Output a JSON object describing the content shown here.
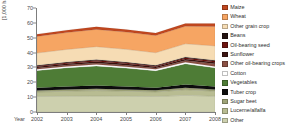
{
  "chart_data": {
    "type": "area",
    "stacked": true,
    "title": "",
    "xlabel": "Year",
    "ylabel": "[1,000 ha]",
    "ylim": [
      0,
      70
    ],
    "yticks": [
      0,
      10,
      20,
      30,
      40,
      50,
      60,
      70
    ],
    "grid": false,
    "legend_position": "right",
    "x": [
      2002,
      2003,
      2004,
      2005,
      2006,
      2007,
      2008
    ],
    "categories": [
      "2002",
      "2003",
      "2004",
      "2005",
      "2006",
      "2007",
      "2008"
    ],
    "series": [
      {
        "name": "Other",
        "color": "#cdd0ae",
        "values": [
          10.4,
          10.6,
          10.8,
          10.6,
          10.4,
          11.2,
          10.6
        ]
      },
      {
        "name": "Lucerne/alfalfa",
        "color": "#b8bc92",
        "values": [
          3.0,
          3.4,
          3.6,
          3.4,
          3.1,
          3.8,
          3.4
        ]
      },
      {
        "name": "Sugar beet",
        "color": "#9fa478",
        "values": [
          1.1,
          1.2,
          1.3,
          1.2,
          1.1,
          1.3,
          1.2
        ]
      },
      {
        "name": "Tuber crop",
        "color": "#0d0d0d",
        "values": [
          1.8,
          2.0,
          2.1,
          2.0,
          1.8,
          2.2,
          2.0
        ]
      },
      {
        "name": "Vegetables",
        "color": "#4e7c36",
        "values": [
          11.6,
          12.6,
          13.2,
          12.4,
          11.4,
          14.0,
          12.6
        ]
      },
      {
        "name": "Cotton",
        "color": "#ffffff",
        "values": [
          0.9,
          0.9,
          1.0,
          0.9,
          0.9,
          1.0,
          0.9
        ]
      },
      {
        "name": "Other oil-bearing crops",
        "color": "#8b5144",
        "values": [
          0.8,
          0.9,
          1.0,
          1.0,
          0.9,
          1.2,
          1.8
        ]
      },
      {
        "name": "Sunflower",
        "color": "#3c1411",
        "values": [
          0.8,
          0.9,
          1.0,
          0.9,
          0.8,
          1.0,
          1.0
        ]
      },
      {
        "name": "Oil-bearing seed",
        "color": "#6d140f",
        "values": [
          0.6,
          0.7,
          0.8,
          0.7,
          0.6,
          0.8,
          0.8
        ]
      },
      {
        "name": "Beans",
        "color": "#231210",
        "values": [
          0.5,
          0.5,
          0.6,
          0.5,
          0.5,
          0.6,
          0.6
        ]
      },
      {
        "name": "Other grain crop",
        "color": "#f6dcb4",
        "values": [
          8.2,
          8.4,
          8.6,
          8.6,
          8.4,
          8.8,
          9.6
        ]
      },
      {
        "name": "Wheat",
        "color": "#f6a563",
        "values": [
          11.2,
          11.4,
          11.6,
          11.6,
          11.6,
          11.8,
          13.0
        ]
      },
      {
        "name": "Maize",
        "color": "#c0471f",
        "values": [
          1.5,
          1.6,
          1.7,
          1.7,
          1.7,
          1.8,
          2.0
        ]
      }
    ],
    "totals": [
      52.4,
      55.1,
      57.3,
      55.5,
      53.2,
      59.5,
      59.5
    ],
    "annotations": []
  },
  "legend": {
    "items": [
      {
        "label": "Maize",
        "color": "#c0471f"
      },
      {
        "label": "Wheat",
        "color": "#f6a563"
      },
      {
        "label": "Other grain crop",
        "color": "#f6dcb4"
      },
      {
        "label": "Beans",
        "color": "#231210"
      },
      {
        "label": "Oil-bearing seed",
        "color": "#6d140f"
      },
      {
        "label": "Sunflower",
        "color": "#3c1411"
      },
      {
        "label": "Other oil-bearing crops",
        "color": "#8b5144"
      },
      {
        "label": "Cotton",
        "color": "#ffffff"
      },
      {
        "label": "Vegetables",
        "color": "#4e7c36"
      },
      {
        "label": "Tuber crop",
        "color": "#0d0d0d"
      },
      {
        "label": "Sugar beet",
        "color": "#9fa478"
      },
      {
        "label": "Lucerne/alfalfa",
        "color": "#b8bc92"
      },
      {
        "label": "Other",
        "color": "#cdd0ae"
      }
    ]
  },
  "axes": {
    "y_title": "[1,000 ha]",
    "x_title": "Year",
    "y_ticks": [
      "70",
      "60",
      "50",
      "40",
      "30",
      "20",
      "10",
      "0"
    ],
    "x_ticks": [
      "2002",
      "2003",
      "2004",
      "2005",
      "2006",
      "2007",
      "2008"
    ]
  }
}
